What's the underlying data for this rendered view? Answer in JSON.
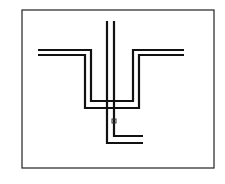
{
  "diagram": {
    "frame": {
      "x": 22,
      "y": 10,
      "width": 192,
      "height": 158
    },
    "colors": {
      "stroke": "#111111",
      "background": "#ffffff",
      "frame": "#222222"
    },
    "paths": [
      {
        "id": "u-inner",
        "points": [
          [
            38,
            50
          ],
          [
            91,
            50
          ],
          [
            91,
            101
          ],
          [
            133,
            101
          ],
          [
            133,
            50
          ],
          [
            184,
            50
          ]
        ]
      },
      {
        "id": "u-outer",
        "points": [
          [
            38,
            55
          ],
          [
            85,
            55
          ],
          [
            85,
            108
          ],
          [
            139,
            108
          ],
          [
            139,
            55
          ],
          [
            184,
            55
          ]
        ]
      },
      {
        "id": "vertical-left",
        "points": [
          [
            107,
            21
          ],
          [
            107,
            143
          ],
          [
            143,
            143
          ]
        ]
      },
      {
        "id": "vertical-right",
        "points": [
          [
            114,
            21
          ],
          [
            114,
            136
          ],
          [
            143,
            136
          ]
        ]
      }
    ],
    "marker": {
      "x": 112,
      "y": 119,
      "size": 4
    }
  }
}
